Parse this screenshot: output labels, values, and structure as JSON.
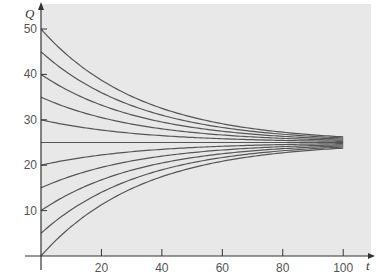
{
  "chart_data": {
    "type": "line",
    "title": "",
    "xlabel": "t",
    "ylabel": "Q",
    "xlim": [
      0,
      100
    ],
    "ylim": [
      0,
      50
    ],
    "x_ticks": [
      20,
      40,
      60,
      80,
      100
    ],
    "y_ticks": [
      10,
      20,
      30,
      40,
      50
    ],
    "grid": false,
    "legend": null,
    "equilibrium": 25,
    "initial_values": [
      0,
      5,
      10,
      15,
      20,
      25,
      30,
      35,
      40,
      45,
      50
    ],
    "decay_rate": 0.03,
    "series": [
      {
        "name": "Q0=50",
        "x": [
          0,
          20,
          40,
          60,
          80,
          100
        ],
        "values": [
          50,
          38.7,
          32.5,
          29.1,
          27.3,
          26.2
        ]
      },
      {
        "name": "Q0=45",
        "x": [
          0,
          20,
          40,
          60,
          80,
          100
        ],
        "values": [
          45,
          36.0,
          31.0,
          28.3,
          26.8,
          26.0
        ]
      },
      {
        "name": "Q0=40",
        "x": [
          0,
          20,
          40,
          60,
          80,
          100
        ],
        "values": [
          40,
          33.2,
          29.5,
          27.5,
          26.4,
          25.7
        ]
      },
      {
        "name": "Q0=35",
        "x": [
          0,
          20,
          40,
          60,
          80,
          100
        ],
        "values": [
          35,
          30.5,
          28.0,
          26.7,
          25.9,
          25.5
        ]
      },
      {
        "name": "Q0=30",
        "x": [
          0,
          20,
          40,
          60,
          80,
          100
        ],
        "values": [
          30,
          27.7,
          26.5,
          25.8,
          25.5,
          25.2
        ]
      },
      {
        "name": "Q0=25",
        "x": [
          0,
          20,
          40,
          60,
          80,
          100
        ],
        "values": [
          25,
          25,
          25,
          25,
          25,
          25
        ]
      },
      {
        "name": "Q0=20",
        "x": [
          0,
          20,
          40,
          60,
          80,
          100
        ],
        "values": [
          20,
          22.3,
          23.5,
          24.2,
          24.5,
          24.8
        ]
      },
      {
        "name": "Q0=15",
        "x": [
          0,
          20,
          40,
          60,
          80,
          100
        ],
        "values": [
          15,
          19.5,
          22.0,
          23.3,
          24.1,
          24.5
        ]
      },
      {
        "name": "Q0=10",
        "x": [
          0,
          20,
          40,
          60,
          80,
          100
        ],
        "values": [
          10,
          16.8,
          20.5,
          22.5,
          23.6,
          24.3
        ]
      },
      {
        "name": "Q0=5",
        "x": [
          0,
          20,
          40,
          60,
          80,
          100
        ],
        "values": [
          5,
          14.0,
          19.0,
          21.7,
          23.2,
          24.0
        ]
      },
      {
        "name": "Q0=0",
        "x": [
          0,
          20,
          40,
          60,
          80,
          100
        ],
        "values": [
          0,
          11.3,
          17.5,
          20.9,
          22.7,
          23.8
        ]
      }
    ]
  },
  "style": {
    "plot_background": "#e8e8e8",
    "curve_color": "#555555",
    "axis_color": "#333333"
  }
}
